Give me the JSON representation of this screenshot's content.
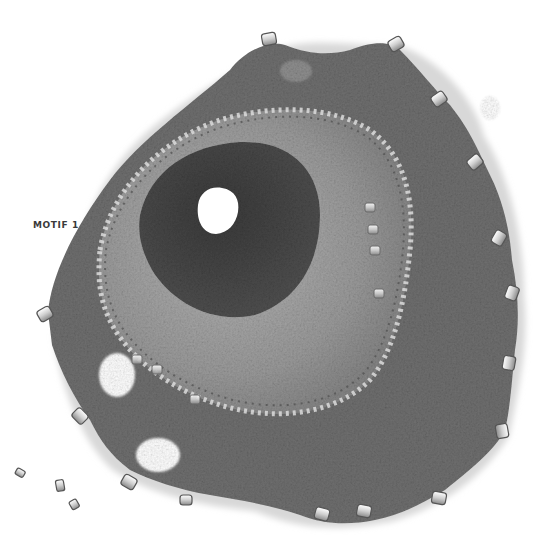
{
  "caption": {
    "label": "MOTIF 1"
  },
  "image": {
    "subject": "crocheted beaded motif",
    "palette": {
      "background": "#ffffff",
      "outer_ring": "#6f6f6f",
      "middle_ring": "#9a9a9a",
      "inner_ring": "#4a4a4a",
      "center_hole": "#ffffff",
      "bead": "#e6e6e6",
      "bead_edge": "#5a5a5a",
      "caption_text": "#3a3a3a"
    },
    "loose_beads": 3
  }
}
